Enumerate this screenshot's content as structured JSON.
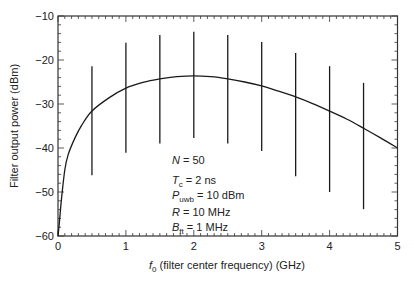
{
  "chart_data": {
    "type": "line",
    "title": "",
    "xlabel": "f0 (filter center frequency) (GHz)",
    "xlabel_parts": {
      "symbol": "f",
      "subscript": "0",
      "rest": " (filter center frequency) (GHz)"
    },
    "ylabel": "Filter output power (dBm)",
    "xlim": [
      0,
      5
    ],
    "ylim": [
      -60,
      -10
    ],
    "x_ticks": [
      0,
      1,
      2,
      3,
      4,
      5
    ],
    "x_tick_labels": [
      "0",
      "1",
      "2",
      "3",
      "4",
      "5"
    ],
    "y_ticks": [
      -60,
      -50,
      -40,
      -30,
      -20,
      -10
    ],
    "y_tick_labels": [
      "−60",
      "−50",
      "−40",
      "−30",
      "−20",
      "−10"
    ],
    "x_minor_step": 0.1,
    "y_minor_step": 2,
    "grid": false,
    "legend": null,
    "series": [
      {
        "name": "mean filter output power",
        "style": "solid curve",
        "x": [
          0.0,
          0.02,
          0.05,
          0.1,
          0.15,
          0.25,
          0.35,
          0.5,
          0.75,
          1.0,
          1.25,
          1.5,
          1.75,
          2.0,
          2.25,
          2.5,
          2.75,
          3.0,
          3.25,
          3.5,
          3.75,
          4.0,
          4.25,
          4.5,
          4.75,
          5.0
        ],
        "y": [
          -60,
          -57,
          -51.8,
          -45,
          -41.5,
          -37.7,
          -34.8,
          -31.6,
          -28.6,
          -26.4,
          -25.1,
          -24.3,
          -23.8,
          -23.6,
          -23.8,
          -24.3,
          -25.0,
          -25.9,
          -27.1,
          -28.4,
          -29.9,
          -31.6,
          -33.4,
          -35.5,
          -37.7,
          -40.0
        ]
      },
      {
        "name": "output power range (error bars)",
        "style": "vertical bars",
        "x": [
          0.5,
          1.0,
          1.5,
          2.0,
          2.5,
          3.0,
          3.5,
          4.0,
          4.5
        ],
        "center": [
          -31.6,
          -26.4,
          -24.3,
          -23.6,
          -24.3,
          -25.9,
          -28.4,
          -31.6,
          -35.5
        ],
        "top": [
          -21.4,
          -16.1,
          -14.3,
          -13.6,
          -14.3,
          -15.9,
          -18.4,
          -21.4,
          -25.2
        ],
        "bottom": [
          -46.2,
          -41.1,
          -39.0,
          -37.7,
          -39.0,
          -40.7,
          -46.4,
          -50.0,
          -53.9
        ]
      }
    ],
    "annotations": [
      {
        "symbol": "N",
        "subscript": "",
        "rest": " = 50"
      },
      {
        "symbol": "T",
        "subscript": "c",
        "rest": " = 2 ns"
      },
      {
        "symbol": "P",
        "subscript": "uwb",
        "rest": " = 10 dBm"
      },
      {
        "symbol": "R",
        "subscript": "",
        "rest": " = 10 MHz"
      },
      {
        "symbol": "B",
        "subscript": "ft",
        "rest": " = 1 MHz"
      }
    ],
    "colors": {
      "line": "#1a1a1a",
      "axis": "#333333",
      "text": "#222222",
      "background": "#ffffff"
    }
  }
}
